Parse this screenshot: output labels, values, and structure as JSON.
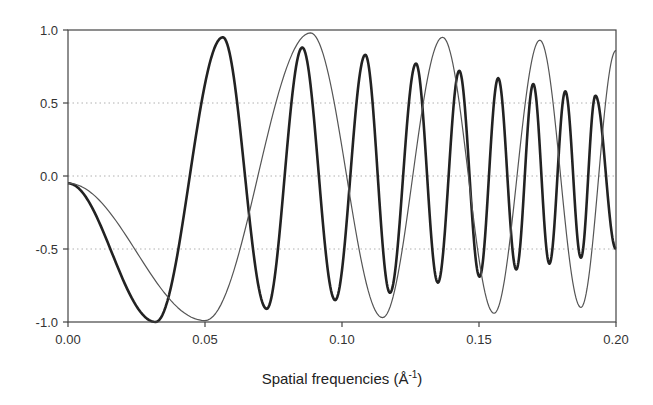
{
  "chart_data": {
    "type": "line",
    "title": "",
    "xlabel": "Spatial frequencies (Å",
    "xlabel_sup": "-1",
    "xlabel_close": ")",
    "ylabel": "",
    "xlim": [
      0.0,
      0.2
    ],
    "ylim": [
      -1.0,
      1.0
    ],
    "x_ticks": [
      0.0,
      0.05,
      0.1,
      0.15,
      0.2
    ],
    "x_tick_labels": [
      "0.00",
      "0.05",
      "0.10",
      "0.15",
      "0.20"
    ],
    "y_ticks": [
      1.0,
      0.5,
      0.0,
      -0.5,
      -1.0
    ],
    "y_tick_labels": [
      "1.0",
      "0.5",
      "0.0",
      "-0.5",
      "-1.0"
    ],
    "grid": {
      "horizontal": true,
      "style": "dotted",
      "color": "#b0b0b0"
    },
    "legend": null,
    "series": [
      {
        "name": "thick curve (faster oscillation)",
        "color": "#222222",
        "width": 2.6,
        "extrema": [
          [
            0.0,
            -0.05
          ],
          [
            0.032,
            -1.0
          ],
          [
            0.0565,
            0.95
          ],
          [
            0.0725,
            -0.91
          ],
          [
            0.0855,
            0.88
          ],
          [
            0.0975,
            -0.85
          ],
          [
            0.1085,
            0.83
          ],
          [
            0.1175,
            -0.8
          ],
          [
            0.127,
            0.77
          ],
          [
            0.135,
            -0.73
          ],
          [
            0.1428,
            0.72
          ],
          [
            0.1502,
            -0.69
          ],
          [
            0.157,
            0.67
          ],
          [
            0.1636,
            -0.64
          ],
          [
            0.1698,
            0.63
          ],
          [
            0.1757,
            -0.6
          ],
          [
            0.1815,
            0.58
          ],
          [
            0.1872,
            -0.56
          ],
          [
            0.1925,
            0.55
          ],
          [
            0.2,
            -0.5
          ]
        ]
      },
      {
        "name": "thin curve (slower oscillation)",
        "color": "#555555",
        "width": 1.2,
        "extrema": [
          [
            0.0,
            -0.05
          ],
          [
            0.05,
            -0.99
          ],
          [
            0.0885,
            0.98
          ],
          [
            0.1148,
            -0.97
          ],
          [
            0.1367,
            0.95
          ],
          [
            0.1555,
            -0.94
          ],
          [
            0.1722,
            0.93
          ],
          [
            0.1872,
            -0.9
          ],
          [
            0.2,
            0.86
          ]
        ]
      }
    ]
  },
  "layout": {
    "plot_left": 68,
    "plot_right": 616,
    "plot_top": 30,
    "plot_bottom": 322
  }
}
